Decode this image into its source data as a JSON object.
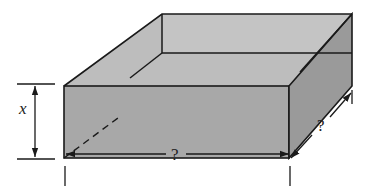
{
  "diagram": {
    "labels": {
      "height": "x",
      "length": "?",
      "width": "?"
    },
    "colors": {
      "front_face": "#a9a9a9",
      "top_rim_face": "#c2c2c2",
      "inner_back_wall": "#b9b9b9",
      "right_face": "#9c9c9c",
      "outline": "#1a1a1a"
    }
  }
}
